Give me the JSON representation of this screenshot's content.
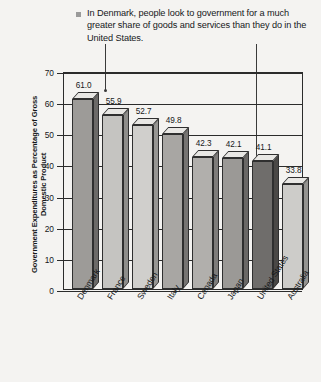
{
  "caption": {
    "bullet": "square-bullet",
    "text": "In Denmark, people look to government for a much greater share of goods and services than they do in the United States."
  },
  "chart_data": {
    "type": "bar",
    "title": "In Denmark, people look to government for a much greater share of goods and services than they do in the United States.",
    "xlabel": "",
    "ylabel": "Government Expenditures as Percentage of Gross Domestic Product",
    "categories": [
      "Denmark",
      "France",
      "Sweden",
      "Italy",
      "Canada",
      "Japan",
      "United States",
      "Australia"
    ],
    "values": [
      61.0,
      55.9,
      52.7,
      49.8,
      42.3,
      42.1,
      41.1,
      33.8
    ],
    "value_labels": [
      "61.0",
      "55.9",
      "52.7",
      "49.8",
      "42.3",
      "42.1",
      "41.1",
      "33.8"
    ],
    "ylim": [
      0,
      70
    ],
    "yticks": [
      0,
      10,
      20,
      30,
      40,
      50,
      60,
      70
    ],
    "ytick_labels": [
      "0",
      "10",
      "20",
      "30",
      "40",
      "50",
      "60",
      "70"
    ],
    "grid": true,
    "legend": "none",
    "bar_colors": [
      "#9c9a97",
      "#c3c2bf",
      "#cfcecb",
      "#a7a5a2",
      "#b0aeab",
      "#99perc",
      "#6e6c6a",
      "#cbcac7"
    ],
    "annotations": [
      {
        "label": "leader-line-denmark",
        "target": "Denmark"
      },
      {
        "label": "leader-line-united-states",
        "target": "United States"
      }
    ]
  },
  "axis": {
    "ylabel": "Government Expenditures as Percentage of Gross Domestic Product"
  }
}
